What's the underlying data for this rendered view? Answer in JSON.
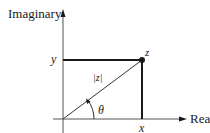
{
  "diagram": {
    "axes": {
      "vertical_label": "Imaginary",
      "horizontal_label": "Real"
    },
    "point_label": "z",
    "modulus_label": "|z|",
    "angle_label": "θ",
    "x_label": "x",
    "y_label": "y",
    "colors": {
      "ink": "#1a1a1a",
      "background": "#ffffff"
    }
  }
}
